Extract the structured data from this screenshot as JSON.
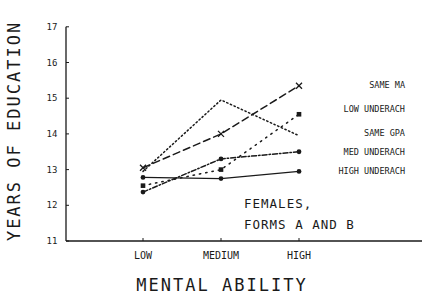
{
  "chart_data": {
    "type": "line",
    "title": "",
    "annotation": [
      "FEMALES,",
      "FORMS A AND B"
    ],
    "xlabel": "MENTAL ABILITY",
    "ylabel": "YEARS OF EDUCATION",
    "categories": [
      "LOW",
      "MEDIUM",
      "HIGH"
    ],
    "ylim": [
      11,
      17
    ],
    "yticks": [
      11,
      12,
      13,
      14,
      15,
      16,
      17
    ],
    "grid": false,
    "legend_position": "right, labels at line ends",
    "series": [
      {
        "name": "SAME MA",
        "style": "dashed",
        "marker": "x",
        "values": [
          13.05,
          14.0,
          15.35
        ]
      },
      {
        "name": "LOW UNDERACH",
        "style": "sparse-dotted",
        "marker": "square",
        "values": [
          12.55,
          13.0,
          14.55
        ]
      },
      {
        "name": "SAME GPA",
        "style": "dotted",
        "marker": "none",
        "values": [
          12.95,
          14.95,
          13.95
        ]
      },
      {
        "name": "MED UNDERACH",
        "style": "dash-dot",
        "marker": "dot",
        "values": [
          12.37,
          13.3,
          13.5
        ]
      },
      {
        "name": "HIGH UNDERACH",
        "style": "solid",
        "marker": "dot",
        "values": [
          12.78,
          12.75,
          12.95
        ]
      }
    ]
  },
  "colors": {
    "ink": "#1a1a1a",
    "background": "#ffffff"
  }
}
